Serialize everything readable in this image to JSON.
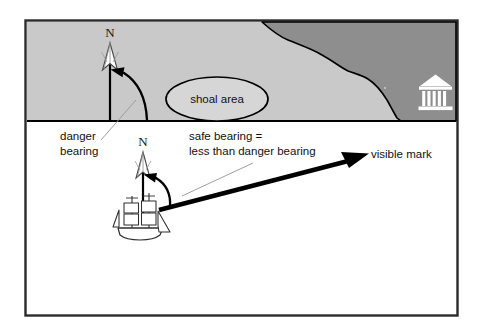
{
  "diagram": {
    "frame": {
      "border_color": "#2b2b2b",
      "background": "#ffffff"
    },
    "colors": {
      "water_white": "#ffffff",
      "shallow_gray": "#c9c9c9",
      "land_dark_gray": "#8e8e8e",
      "shoal_fill": "#d6d6d6",
      "outline": "#000000",
      "leader_line": "#8a8a8a",
      "mark_icon": "#ffffff"
    },
    "regions": [
      {
        "name": "shallow-water-region",
        "label": "",
        "fill": "#c9c9c9"
      },
      {
        "name": "land-region",
        "label": "",
        "fill": "#8e8e8e"
      },
      {
        "name": "open-water-region",
        "label": "",
        "fill": "#ffffff"
      }
    ],
    "shoal": {
      "label": "shoal area",
      "shape": "ellipse"
    },
    "compass_north": {
      "label": "N",
      "count": 2,
      "names": [
        "north-arrow-danger",
        "north-arrow-ship"
      ]
    },
    "labels": {
      "danger_bearing_line1": "danger",
      "danger_bearing_line2": "bearing",
      "safe_bearing_line1": "safe bearing =",
      "safe_bearing_line2": "less than danger bearing",
      "visible_mark": "visible mark"
    },
    "icons": {
      "landmark": "temple-icon",
      "vessel": "sailing-ship-icon",
      "north": "north-arrow-icon",
      "bearing_arc": "bearing-arc-icon"
    },
    "bearings": {
      "danger_arc_name": "danger-bearing-arc",
      "safe_arc_name": "safe-bearing-arc",
      "sight_line_name": "bearing-sight-line"
    }
  }
}
